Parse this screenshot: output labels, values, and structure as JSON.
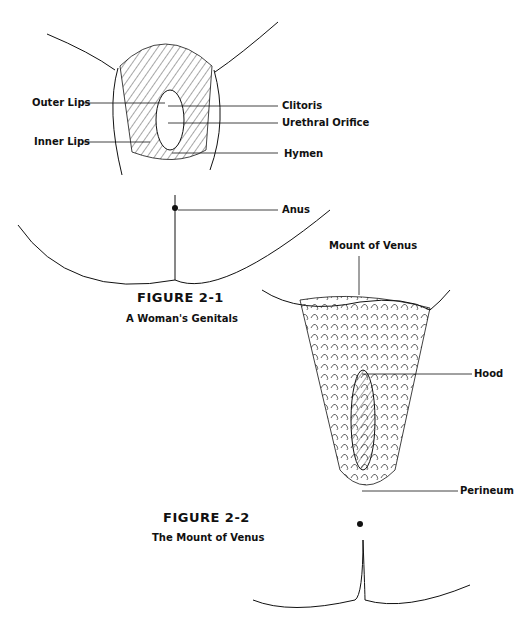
{
  "figures": [
    {
      "id": "2-1",
      "title": "FIGURE 2-1",
      "caption": "A Woman's Genitals",
      "labels": {
        "outer_lips": "Outer Lips",
        "inner_lips": "Inner Lips",
        "clitoris": "Clitoris",
        "urethral_orifice": "Urethral Orifice",
        "hymen": "Hymen",
        "anus": "Anus"
      }
    },
    {
      "id": "2-2",
      "title": "FIGURE 2-2",
      "caption": "The Mount of Venus",
      "labels": {
        "mount_of_venus": "Mount of Venus",
        "hood": "Hood",
        "perineum": "Perineum"
      }
    }
  ],
  "colors": {
    "ink": "#111111",
    "paper": "#ffffff"
  }
}
